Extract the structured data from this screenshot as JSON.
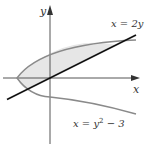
{
  "diagram": {
    "axes": {
      "x_label": "x",
      "y_label": "y"
    },
    "curves": [
      {
        "name": "parabola",
        "equation": "x = y² − 3",
        "label_main": "x = y",
        "label_exp": "2",
        "label_tail": " − 3",
        "color": "#8a8a8a"
      },
      {
        "name": "line",
        "equation": "x = 2y",
        "label": "x = 2y",
        "color": "#111111"
      }
    ],
    "region": {
      "fill": "#e6e6e6",
      "bounds_y": [
        -1,
        3
      ]
    },
    "intersections": [
      {
        "x": -2,
        "y": -1
      },
      {
        "x": 6,
        "y": 3
      }
    ],
    "colors": {
      "axis": "#555555",
      "line": "#111111",
      "parabola": "#8a8a8a",
      "shade": "#e6e6e6"
    }
  }
}
